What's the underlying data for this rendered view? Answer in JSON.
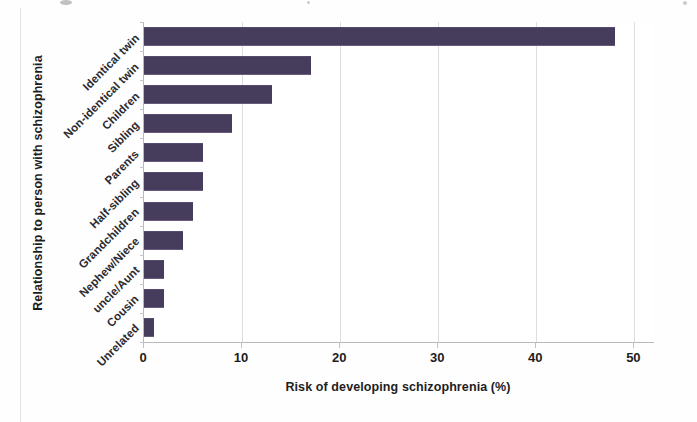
{
  "chart_data": {
    "type": "bar",
    "orientation": "horizontal",
    "title": "",
    "xlabel": "Risk of developing schizophrenia (%)",
    "ylabel": "Relationship to person with schizophrenia",
    "categories": [
      "Identical twin",
      "Non-identical twin",
      "Children",
      "Sibling",
      "Parents",
      "Half-sibling",
      "Grandchildren",
      "Nephew/Niece",
      "uncle/Aunt",
      "Cousin",
      "Unrelated"
    ],
    "values": [
      48,
      17,
      13,
      9,
      6,
      6,
      5,
      4,
      2,
      2,
      1
    ],
    "xlim": [
      0,
      52
    ],
    "xticks": [
      0,
      10,
      20,
      30,
      40,
      50
    ],
    "xtick_labels": [
      "0",
      "10",
      "20",
      "30",
      "40",
      "50"
    ],
    "grid": "vertical",
    "legend": "none",
    "bar_color": "#463c5c"
  },
  "figure": {
    "axis_line_color": "#b9b9be",
    "gridline_color": "#dedee2",
    "background_color": "#ffffff"
  }
}
